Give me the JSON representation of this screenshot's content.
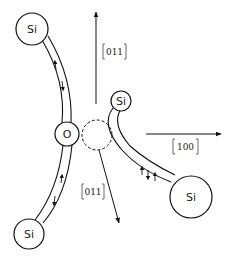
{
  "diagram": {
    "atoms": [
      {
        "id": "si-top-left",
        "label": "Si"
      },
      {
        "id": "oxygen",
        "label": "O"
      },
      {
        "id": "si-bottom-left",
        "label": "Si"
      },
      {
        "id": "si-small",
        "label": "Si"
      },
      {
        "id": "si-right",
        "label": "Si"
      }
    ],
    "directions": {
      "up": "011",
      "right": "100",
      "down": "011"
    },
    "vacancy": "dashed-circle",
    "bond_spin_arrows": {
      "top_left_bond": [
        "up",
        "down"
      ],
      "bottom_left_bond": [
        "up",
        "down"
      ],
      "right_bond": [
        "up",
        "down",
        "up"
      ]
    }
  }
}
